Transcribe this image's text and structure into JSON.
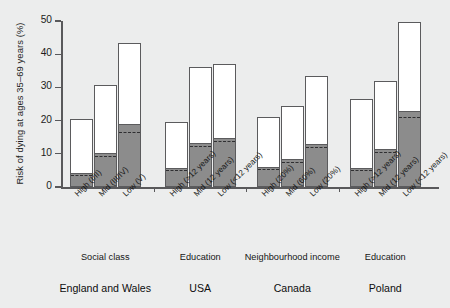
{
  "chart_data": {
    "type": "bar",
    "title": "",
    "subtitle": "",
    "xlabel": "",
    "ylabel": "Risk of dying at ages 35–69 years (%)",
    "ylim": [
      0,
      50
    ],
    "yticks": [
      0,
      10,
      20,
      30,
      40,
      50
    ],
    "ytick_labels": [
      "0",
      "10",
      "20",
      "30",
      "40",
      "50"
    ],
    "grid": false,
    "legend": "none",
    "stacked": true,
    "series": [
      {
        "name": "Smoking-attributable (shaded lower segment)",
        "color": "#8c8c8c"
      },
      {
        "name": "Non-smoking (white upper segment)",
        "color": "#ffffff"
      }
    ],
    "annotation": "Dashed line within each shaded segment marks an internal sub-level",
    "groups": [
      {
        "country": "England and Wales",
        "measure": "Social class",
        "categories": [
          "High (I/II)",
          "Mid (III/IV)",
          "Low (V)"
        ],
        "total": [
          20.5,
          30.8,
          43.4
        ],
        "shaded": [
          3.8,
          9.8,
          18.6
        ],
        "dashed": [
          3.0,
          8.6,
          16.1
        ]
      },
      {
        "country": "USA",
        "measure": "Education",
        "categories": [
          "High (>12 years)",
          "Mid (12 years)",
          "Low (<12 years)"
        ],
        "total": [
          19.5,
          36.0,
          37.0
        ],
        "shaded": [
          5.5,
          13.0,
          14.5
        ],
        "dashed": [
          4.6,
          11.8,
          13.4
        ]
      },
      {
        "country": "Canada",
        "measure": "Neighbourhood income",
        "categories": [
          "High (20%)",
          "Mid (60%)",
          "Low (20%)"
        ],
        "total": [
          21.0,
          24.5,
          33.3
        ],
        "shaded": [
          5.7,
          8.0,
          12.8
        ],
        "dashed": [
          4.8,
          7.0,
          11.6
        ]
      },
      {
        "country": "Poland",
        "measure": "Education",
        "categories": [
          "High (>12 years)",
          "Mid (12 years)",
          "Low (<12 years)"
        ],
        "total": [
          26.5,
          32.0,
          49.8
        ],
        "shaded": [
          5.5,
          11.0,
          22.7
        ],
        "dashed": [
          4.6,
          9.9,
          20.6
        ]
      }
    ]
  },
  "colors": {
    "background": "#eceded",
    "bar_shaded": "#8c8c8c",
    "bar_white": "#ffffff",
    "bar_outline": "#5b5b5d",
    "axis": "#59595b",
    "dash": "#2f2f31",
    "text": "#151515"
  }
}
